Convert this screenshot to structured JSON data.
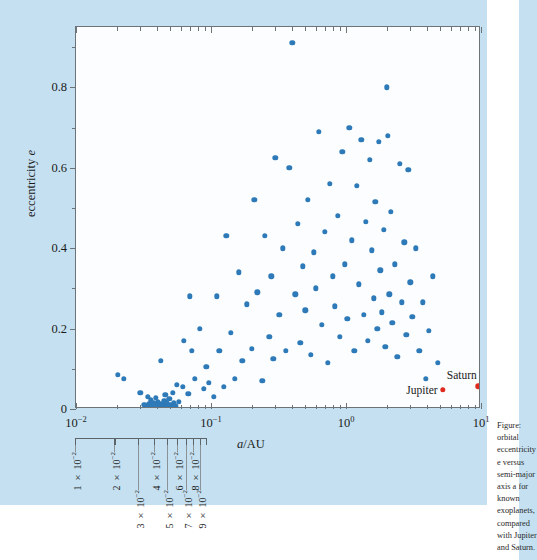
{
  "figure": {
    "axes": {
      "x": {
        "title": "a/AU",
        "title_italic_part": "a",
        "scale": "log",
        "range": [
          0.01,
          10
        ],
        "tick_labels": [
          "10⁻²",
          "10⁻¹",
          "10⁰",
          "10¹"
        ],
        "tick_values": [
          0.01,
          0.1,
          1,
          10
        ]
      },
      "y": {
        "title": "eccentricity e",
        "title_italic_part": "e",
        "scale": "linear",
        "range": [
          0,
          0.95
        ],
        "tick_labels": [
          "0",
          "0.2",
          "0.4",
          "0.6",
          "0.8"
        ],
        "tick_values": [
          0,
          0.2,
          0.4,
          0.6,
          0.8
        ],
        "minor_tick_values": [
          0.1,
          0.3,
          0.5,
          0.7,
          0.9
        ]
      }
    },
    "secondary_axis": {
      "description": "detached logarithmic ruler below x-axis",
      "range": [
        0.01,
        0.1
      ],
      "labels": [
        {
          "text": "1 × 10⁻²",
          "value": 0.01,
          "row": "upper"
        },
        {
          "text": "2 × 10⁻²",
          "value": 0.02,
          "row": "upper"
        },
        {
          "text": "3 × 10⁻²",
          "value": 0.03,
          "row": "lower"
        },
        {
          "text": "4 × 10⁻²",
          "value": 0.04,
          "row": "upper"
        },
        {
          "text": "5 × 10⁻²",
          "value": 0.05,
          "row": "lower"
        },
        {
          "text": "6 × 10⁻²",
          "value": 0.06,
          "row": "upper"
        },
        {
          "text": "7 × 10⁻²",
          "value": 0.07,
          "row": "lower"
        },
        {
          "text": "8 × 10⁻²",
          "value": 0.08,
          "row": "upper"
        },
        {
          "text": "9 × 10⁻²",
          "value": 0.09,
          "row": "lower"
        }
      ]
    },
    "annotations": [
      {
        "name": "jupiter",
        "label": "Jupiter",
        "a": 5.2,
        "e": 0.048,
        "color": "#e02a1e"
      },
      {
        "name": "saturn",
        "label": "Saturn",
        "a": 9.54,
        "e": 0.056,
        "color": "#e02a1e"
      }
    ],
    "colors": {
      "page_background": "#c5e0f0",
      "panel_background": "#fbfdfe",
      "marker": "#2e7ab8",
      "planet_marker": "#e02a1e",
      "axis": "#6d7478"
    },
    "caption": "Figure: orbital eccentricity e versus semi-major axis a for known exoplanets, compared with Jupiter and Saturn."
  },
  "chart_data": {
    "type": "scatter",
    "title": "",
    "xlabel": "a/AU",
    "ylabel": "eccentricity e",
    "xscale": "log",
    "yscale": "linear",
    "xlim": [
      0.01,
      10
    ],
    "ylim": [
      0,
      0.95
    ],
    "grid": false,
    "legend": "none",
    "series": [
      {
        "name": "exoplanets",
        "color": "#2e7ab8",
        "points": [
          [
            0.0205,
            0.085
          ],
          [
            0.0225,
            0.075
          ],
          [
            0.03,
            0.04
          ],
          [
            0.032,
            0.01
          ],
          [
            0.0335,
            0.008
          ],
          [
            0.034,
            0.03
          ],
          [
            0.035,
            0.012
          ],
          [
            0.0355,
            0.006
          ],
          [
            0.036,
            0.022
          ],
          [
            0.0365,
            0.004
          ],
          [
            0.0375,
            0.016
          ],
          [
            0.038,
            0.002
          ],
          [
            0.039,
            0.028
          ],
          [
            0.0395,
            0.01
          ],
          [
            0.04,
            0.005
          ],
          [
            0.0405,
            0.018
          ],
          [
            0.041,
            0.003
          ],
          [
            0.042,
            0.012
          ],
          [
            0.0425,
            0.12
          ],
          [
            0.043,
            0.007
          ],
          [
            0.044,
            0.002
          ],
          [
            0.045,
            0.02
          ],
          [
            0.0455,
            0.009
          ],
          [
            0.046,
            0.035
          ],
          [
            0.0465,
            0.004
          ],
          [
            0.047,
            0.015
          ],
          [
            0.048,
            0.006
          ],
          [
            0.049,
            0.025
          ],
          [
            0.05,
            0.011
          ],
          [
            0.051,
            0.003
          ],
          [
            0.052,
            0.04
          ],
          [
            0.053,
            0.014
          ],
          [
            0.0545,
            0.007
          ],
          [
            0.056,
            0.06
          ],
          [
            0.058,
            0.018
          ],
          [
            0.062,
            0.055
          ],
          [
            0.063,
            0.17
          ],
          [
            0.068,
            0.038
          ],
          [
            0.07,
            0.28
          ],
          [
            0.072,
            0.145
          ],
          [
            0.076,
            0.075
          ],
          [
            0.083,
            0.2
          ],
          [
            0.088,
            0.05
          ],
          [
            0.092,
            0.105
          ],
          [
            0.096,
            0.065
          ],
          [
            0.105,
            0.03
          ],
          [
            0.11,
            0.28
          ],
          [
            0.115,
            0.145
          ],
          [
            0.125,
            0.055
          ],
          [
            0.13,
            0.43
          ],
          [
            0.14,
            0.19
          ],
          [
            0.15,
            0.075
          ],
          [
            0.16,
            0.34
          ],
          [
            0.17,
            0.12
          ],
          [
            0.185,
            0.26
          ],
          [
            0.2,
            0.15
          ],
          [
            0.21,
            0.52
          ],
          [
            0.22,
            0.29
          ],
          [
            0.24,
            0.07
          ],
          [
            0.25,
            0.43
          ],
          [
            0.27,
            0.18
          ],
          [
            0.28,
            0.33
          ],
          [
            0.29,
            0.125
          ],
          [
            0.3,
            0.625
          ],
          [
            0.32,
            0.235
          ],
          [
            0.34,
            0.4
          ],
          [
            0.36,
            0.145
          ],
          [
            0.38,
            0.6
          ],
          [
            0.4,
            0.91
          ],
          [
            0.42,
            0.285
          ],
          [
            0.44,
            0.46
          ],
          [
            0.46,
            0.165
          ],
          [
            0.48,
            0.355
          ],
          [
            0.5,
            0.245
          ],
          [
            0.52,
            0.52
          ],
          [
            0.55,
            0.135
          ],
          [
            0.58,
            0.39
          ],
          [
            0.6,
            0.3
          ],
          [
            0.63,
            0.69
          ],
          [
            0.66,
            0.21
          ],
          [
            0.7,
            0.44
          ],
          [
            0.73,
            0.115
          ],
          [
            0.76,
            0.56
          ],
          [
            0.8,
            0.33
          ],
          [
            0.83,
            0.255
          ],
          [
            0.87,
            0.48
          ],
          [
            0.9,
            0.18
          ],
          [
            0.94,
            0.64
          ],
          [
            0.98,
            0.36
          ],
          [
            1.02,
            0.225
          ],
          [
            1.06,
            0.7
          ],
          [
            1.1,
            0.42
          ],
          [
            1.15,
            0.145
          ],
          [
            1.2,
            0.555
          ],
          [
            1.25,
            0.31
          ],
          [
            1.3,
            0.67
          ],
          [
            1.35,
            0.235
          ],
          [
            1.4,
            0.465
          ],
          [
            1.45,
            0.17
          ],
          [
            1.5,
            0.62
          ],
          [
            1.55,
            0.395
          ],
          [
            1.6,
            0.275
          ],
          [
            1.65,
            0.515
          ],
          [
            1.7,
            0.2
          ],
          [
            1.75,
            0.665
          ],
          [
            1.8,
            0.345
          ],
          [
            1.85,
            0.24
          ],
          [
            1.9,
            0.445
          ],
          [
            1.95,
            0.155
          ],
          [
            2.0,
            0.8
          ],
          [
            2.05,
            0.68
          ],
          [
            2.1,
            0.285
          ],
          [
            2.15,
            0.49
          ],
          [
            2.2,
            0.215
          ],
          [
            2.3,
            0.36
          ],
          [
            2.4,
            0.13
          ],
          [
            2.5,
            0.61
          ],
          [
            2.6,
            0.265
          ],
          [
            2.7,
            0.415
          ],
          [
            2.8,
            0.185
          ],
          [
            2.9,
            0.595
          ],
          [
            3.0,
            0.315
          ],
          [
            3.1,
            0.23
          ],
          [
            3.3,
            0.4
          ],
          [
            3.5,
            0.145
          ],
          [
            3.7,
            0.265
          ],
          [
            3.9,
            0.075
          ],
          [
            4.1,
            0.195
          ],
          [
            4.4,
            0.33
          ],
          [
            4.8,
            0.115
          ]
        ]
      },
      {
        "name": "solar-system planets",
        "color": "#e02a1e",
        "points": [
          [
            5.2,
            0.048
          ],
          [
            9.54,
            0.056
          ]
        ],
        "labels": [
          "Jupiter",
          "Saturn"
        ]
      }
    ]
  }
}
